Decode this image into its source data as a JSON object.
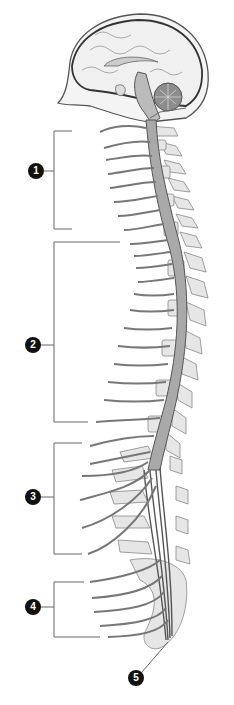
{
  "diagram": {
    "colors": {
      "background": "#ffffff",
      "outline": "#555555",
      "brain_fill": "#f2f2f2",
      "cord_fill": "#a9a9a9",
      "vertebra_fill": "#e6e6e6",
      "nerve_stroke": "#777777",
      "marker_fill": "#111111",
      "marker_text": "#ffffff",
      "bracket": "#666666"
    },
    "markers": [
      {
        "id": 1,
        "label": "1",
        "x": 36,
        "y": 171,
        "bracket_top": 131,
        "bracket_bottom": 229
      },
      {
        "id": 2,
        "label": "2",
        "x": 33,
        "y": 345,
        "bracket_top": 242,
        "bracket_bottom": 422
      },
      {
        "id": 3,
        "label": "3",
        "x": 33,
        "y": 497,
        "bracket_top": 443,
        "bracket_bottom": 554
      },
      {
        "id": 4,
        "label": "4",
        "x": 33,
        "y": 607,
        "bracket_top": 582,
        "bracket_bottom": 637
      },
      {
        "id": 5,
        "label": "5",
        "x": 136,
        "y": 678
      }
    ]
  }
}
